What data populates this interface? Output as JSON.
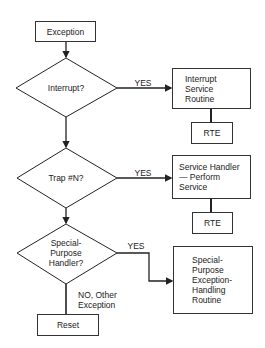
{
  "flowchart": {
    "start": {
      "label": "Exception"
    },
    "decisions": [
      {
        "label": "Interrupt?",
        "yes_label": "YES"
      },
      {
        "label": "Trap #N?",
        "yes_label": "YES"
      },
      {
        "label": "Special-\nPurpose\nHandler?",
        "yes_label": "YES",
        "no_label": "NO, Other\nException"
      }
    ],
    "handlers": [
      {
        "label": "Interrupt\nService\nRoutine",
        "return_label": "RTE"
      },
      {
        "label": "Service Handler\n— Perform\n   Service",
        "return_label": "RTE"
      },
      {
        "label": "Special-\nPurpose\nException-\nHandling\nRoutine"
      }
    ],
    "end": {
      "label": "Reset"
    }
  },
  "colors": {
    "line": "#222222",
    "background": "#ffffff"
  }
}
